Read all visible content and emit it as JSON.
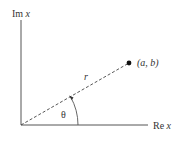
{
  "diagram": {
    "y_axis_label": {
      "prefix": "Im",
      "var": "x"
    },
    "x_axis_label": {
      "prefix": "Re",
      "var": "x"
    },
    "point_label": "(a, b)",
    "radius_label": "r",
    "angle_label": "θ",
    "colors": {
      "line": "#555555",
      "text": "#333333",
      "point": "#111111"
    }
  }
}
